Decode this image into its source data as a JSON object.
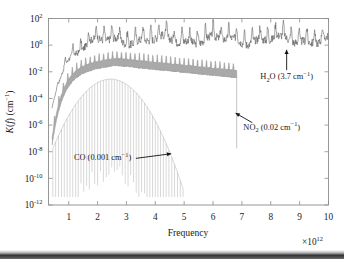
{
  "chart_data": {
    "type": "line",
    "title": "",
    "xlabel": "Frequency",
    "ylabel": "K(f) (cm−1)",
    "x_exponent_label": "×10¹²",
    "x_exponent_base": "10",
    "x_exponent_sup": "12",
    "x_multiplier_prefix": "×",
    "xlim": [
      0.3,
      10
    ],
    "ylim_log10": [
      -12,
      2
    ],
    "xticks": [
      1,
      2,
      3,
      4,
      5,
      6,
      7,
      8,
      9,
      10
    ],
    "xtick_labels": [
      "1",
      "2",
      "3",
      "4",
      "5",
      "6",
      "7",
      "8",
      "9",
      "10"
    ],
    "ytick_exponents": [
      2,
      0,
      -2,
      -4,
      -6,
      -8,
      -10,
      -12
    ],
    "ytick_labels": [
      "10²",
      "10⁰",
      "10⁻²",
      "10⁻⁴",
      "10⁻⁶",
      "10⁻⁸",
      "10⁻¹⁰",
      "10⁻¹²"
    ],
    "ytick_mantissa": "10",
    "ytick_superscripts": [
      "2",
      "0",
      "-2",
      "-4",
      "-6",
      "-8",
      "-10",
      "-12"
    ],
    "grid": false,
    "legend_position": "inline-annotations",
    "series": [
      {
        "name": "H2O",
        "label_text": "H",
        "label_sub": "2",
        "label_rest": "O (3.7 cm",
        "label_sup": "−1",
        "label_close": ")",
        "full_label": "H2O (3.7 cm−1)",
        "concentration_cm_inv": 3.7,
        "color": "#5a5a5a",
        "x_start": 0.42,
        "x_end": 10.0,
        "baseline_log10": 0.35,
        "rise_log10": -5.2,
        "rise_width": 1.05,
        "noise_amp": 0.62,
        "spike_amp": 0.95,
        "spike_period": 0.27,
        "seed": 17,
        "annotation": {
          "x": 8.55,
          "y_log10": -2.55,
          "arrow_to_x": 8.55,
          "arrow_to_y_log10": -0.35
        }
      },
      {
        "name": "NO2",
        "label_text": "NO",
        "label_sub": "2",
        "label_rest": " (0.02 cm",
        "label_sup": "−1",
        "label_close": ")",
        "full_label": "NO2 (0.02 cm−1)",
        "concentration_cm_inv": 0.02,
        "color": "#9a9a9a",
        "x_start": 0.42,
        "x_end": 6.85,
        "cutoff_x": 6.82,
        "cutoff_drop_log10": -5.6,
        "peak_log10": -1.25,
        "peak_x": 2.6,
        "end_log10": -2.15,
        "rise_log10": -5.4,
        "rise_width": 0.95,
        "band_thickness": 0.52,
        "spike_amp": 0.55,
        "spike_period": 0.155,
        "seed": 41,
        "annotation": {
          "x": 7.05,
          "y_log10": -6.35,
          "arrow_to_x": 6.78,
          "arrow_to_y_log10": -5.1
        }
      },
      {
        "name": "CO",
        "label_text": "CO (0.001 cm",
        "label_sup": "−1",
        "label_close": ")",
        "full_label": "CO (0.001 cm−1)",
        "concentration_cm_inv": 0.001,
        "color": "#a8a8a8",
        "x_start": 0.45,
        "x_end": 5.62,
        "peak_log10": -2.55,
        "peak_x": 2.45,
        "envelope_width": 2.35,
        "floor_log10": -11.4,
        "comb_period": 0.0955,
        "comb_depth": 6.3,
        "seed": 73,
        "annotation": {
          "x": 1.18,
          "y_log10": -8.65,
          "arrow_to_x": 4.55,
          "arrow_to_y_log10": -8.15
        }
      }
    ]
  },
  "axes": {
    "frame_color": "#8d8d8d",
    "background": "#ffffff"
  }
}
